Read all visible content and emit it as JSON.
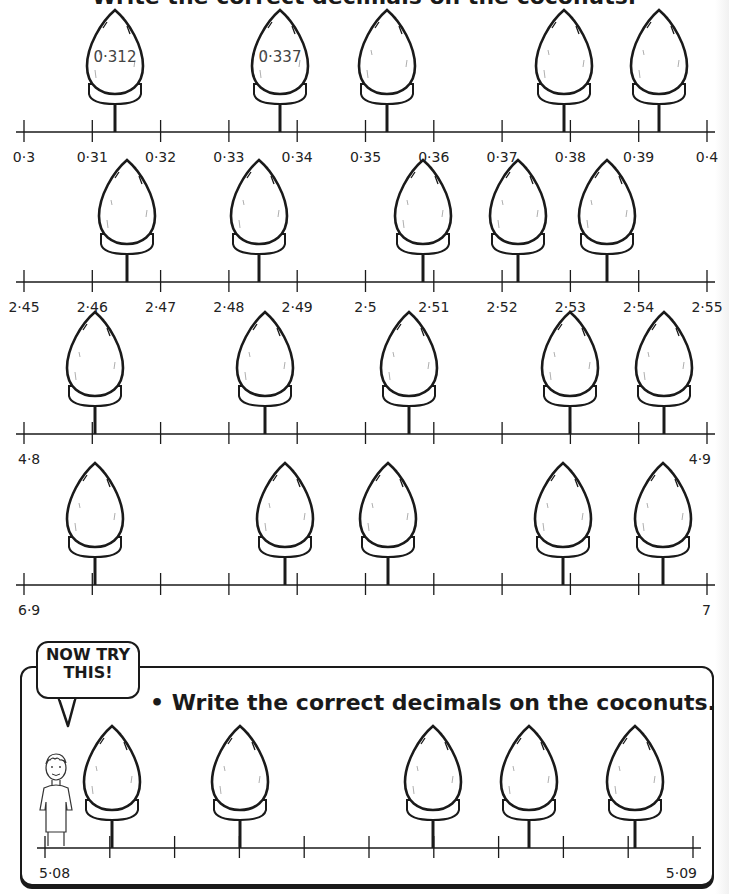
{
  "page": {
    "title": "Write the correct decimals on the coconuts."
  },
  "number_lines": [
    {
      "id": "row1",
      "axis_y": 132,
      "x_start": 24,
      "x_end": 707,
      "tick_count": 11,
      "tick_labels": [
        "0·3",
        "0·31",
        "0·32",
        "0·33",
        "0·34",
        "0·35",
        "0·36",
        "0·37",
        "0·38",
        "0·39",
        "0·4"
      ],
      "label_all": true,
      "coconuts": [
        {
          "x": 115,
          "value": "0·312"
        },
        {
          "x": 280,
          "value": "0·337"
        },
        {
          "x": 387,
          "value": ""
        },
        {
          "x": 564,
          "value": ""
        },
        {
          "x": 659,
          "value": ""
        }
      ]
    },
    {
      "id": "row2",
      "axis_y": 282,
      "x_start": 24,
      "x_end": 707,
      "tick_count": 11,
      "tick_labels": [
        "2·45",
        "2·46",
        "2·47",
        "2·48",
        "2·49",
        "2·5",
        "2·51",
        "2·52",
        "2·53",
        "2·54",
        "2·55"
      ],
      "label_all": true,
      "coconuts": [
        {
          "x": 127,
          "value": ""
        },
        {
          "x": 259,
          "value": ""
        },
        {
          "x": 423,
          "value": ""
        },
        {
          "x": 518,
          "value": ""
        },
        {
          "x": 607,
          "value": ""
        }
      ]
    },
    {
      "id": "row3",
      "axis_y": 434,
      "x_start": 24,
      "x_end": 707,
      "tick_count": 11,
      "tick_labels": [
        "4·8",
        "",
        "",
        "",
        "",
        "",
        "",
        "",
        "",
        "",
        "4·9"
      ],
      "label_all": false,
      "coconuts": [
        {
          "x": 95,
          "value": ""
        },
        {
          "x": 265,
          "value": ""
        },
        {
          "x": 409,
          "value": ""
        },
        {
          "x": 570,
          "value": ""
        },
        {
          "x": 664,
          "value": ""
        }
      ]
    },
    {
      "id": "row4",
      "axis_y": 585,
      "x_start": 24,
      "x_end": 707,
      "tick_count": 11,
      "tick_labels": [
        "6·9",
        "",
        "",
        "",
        "",
        "",
        "",
        "",
        "",
        "",
        "7"
      ],
      "label_all": false,
      "coconuts": [
        {
          "x": 95,
          "value": ""
        },
        {
          "x": 285,
          "value": ""
        },
        {
          "x": 388,
          "value": ""
        },
        {
          "x": 563,
          "value": ""
        },
        {
          "x": 663,
          "value": ""
        }
      ]
    }
  ],
  "now_try_this": {
    "bubble_line1": "NOW TRY",
    "bubble_line2": "THIS!",
    "task": "• Write the correct decimals on the coconuts.",
    "number_line": {
      "id": "row5",
      "axis_y": 848,
      "x_start": 45,
      "x_end": 693,
      "tick_count": 11,
      "tick_labels": [
        "5·08",
        "",
        "",
        "",
        "",
        "",
        "",
        "",
        "",
        "",
        "5·09"
      ],
      "coconuts": [
        {
          "x": 112,
          "value": ""
        },
        {
          "x": 240,
          "value": ""
        },
        {
          "x": 433,
          "value": ""
        },
        {
          "x": 529,
          "value": ""
        },
        {
          "x": 635,
          "value": ""
        }
      ]
    }
  }
}
